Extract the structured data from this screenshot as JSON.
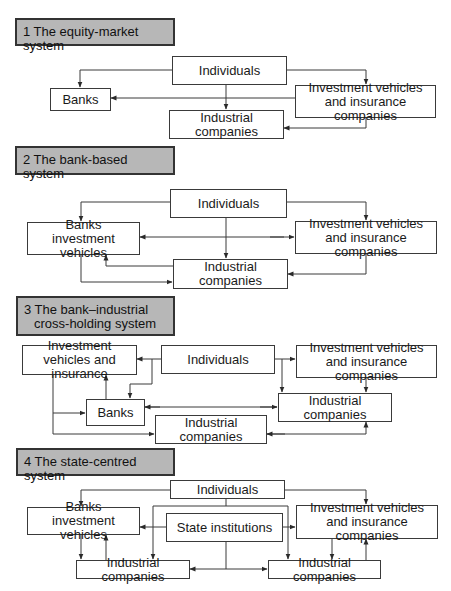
{
  "diagrams": [
    {
      "title": "1 The equity-market system",
      "nodes": {
        "individuals": "Individuals",
        "banks": "Banks",
        "investment_vehicles": "Investment vehicles and insurance companies",
        "industrial": "Industrial companies"
      },
      "edges": [
        {
          "from": "Individuals",
          "to": "Banks"
        },
        {
          "from": "Individuals",
          "to": "Investment vehicles and insurance companies"
        },
        {
          "from": "Individuals",
          "to": "Industrial companies"
        },
        {
          "from": "Investment vehicles and insurance companies",
          "to": "Banks"
        },
        {
          "from": "Investment vehicles and insurance companies",
          "to": "Industrial companies"
        }
      ]
    },
    {
      "title": "2 The bank-based system",
      "nodes": {
        "individuals": "Individuals",
        "banks_inv": "Banks investment vehicles",
        "investment_vehicles": "Investment vehicles and insurance companies",
        "industrial": "Industrial companies"
      },
      "edges": [
        {
          "from": "Individuals",
          "to": "Banks investment vehicles"
        },
        {
          "from": "Individuals",
          "to": "Investment vehicles and insurance companies"
        },
        {
          "from": "Individuals",
          "to": "Industrial companies"
        },
        {
          "from": "Banks investment vehicles",
          "to": "Investment vehicles and insurance companies",
          "bidirectional": true
        },
        {
          "from": "Industrial companies",
          "to": "Banks investment vehicles"
        },
        {
          "from": "Banks investment vehicles",
          "to": "Industrial companies"
        },
        {
          "from": "Investment vehicles and insurance companies",
          "to": "Industrial companies"
        }
      ]
    },
    {
      "title_line1": "3 The bank–industrial",
      "title_line2": "cross-holding system",
      "nodes": {
        "individuals": "Individuals",
        "inv_insurance_left": "Investment vehicles and insurance",
        "investment_vehicles": "Investment vehicles and insurance companies",
        "banks": "Banks",
        "industrial_right": "Industrial companies",
        "industrial_bottom": "Industrial companies"
      },
      "edges": [
        {
          "from": "Individuals",
          "to": "Investment vehicles and insurance"
        },
        {
          "from": "Individuals",
          "to": "Banks"
        },
        {
          "from": "Individuals",
          "to": "Investment vehicles and insurance companies"
        },
        {
          "from": "Individuals",
          "to": "Industrial companies (right)"
        },
        {
          "from": "Banks",
          "to": "Investment vehicles and insurance"
        },
        {
          "from": "Investment vehicles and insurance",
          "to": "Banks"
        },
        {
          "from": "Investment vehicles and insurance",
          "to": "Industrial companies (bottom)"
        },
        {
          "from": "Banks",
          "to": "Industrial companies (right)",
          "bidirectional": true
        },
        {
          "from": "Investment vehicles and insurance companies",
          "to": "Industrial companies (right)"
        },
        {
          "from": "Industrial companies (right)",
          "to": "Industrial companies (bottom)",
          "bidirectional": true
        }
      ]
    },
    {
      "title": "4 The state-centred system",
      "nodes": {
        "individuals": "Individuals",
        "banks_inv": "Banks investment vehicles",
        "state": "State institutions",
        "investment_vehicles": "Investment vehicles and insurance companies",
        "industrial_left": "Industrial companies",
        "industrial_right": "Industrial companies"
      },
      "edges": [
        {
          "from": "Individuals",
          "to": "Banks investment vehicles"
        },
        {
          "from": "Individuals",
          "to": "Investment vehicles and insurance companies"
        },
        {
          "from": "Individuals",
          "to": "Industrial companies (left)"
        },
        {
          "from": "Individuals",
          "to": "Industrial companies (right)"
        },
        {
          "from": "State institutions",
          "to": "Banks investment vehicles"
        },
        {
          "from": "State institutions",
          "to": "Investment vehicles and insurance companies"
        },
        {
          "from": "State institutions",
          "to": "Industrial companies (left)"
        },
        {
          "from": "State institutions",
          "to": "Industrial companies (right)"
        },
        {
          "from": "Banks investment vehicles",
          "to": "Industrial companies (left)"
        },
        {
          "from": "Industrial companies (left)",
          "to": "Banks investment vehicles"
        },
        {
          "from": "Investment vehicles and insurance companies",
          "to": "Industrial companies (right)"
        },
        {
          "from": "Industrial companies (right)",
          "to": "Investment vehicles and insurance companies"
        }
      ]
    }
  ]
}
